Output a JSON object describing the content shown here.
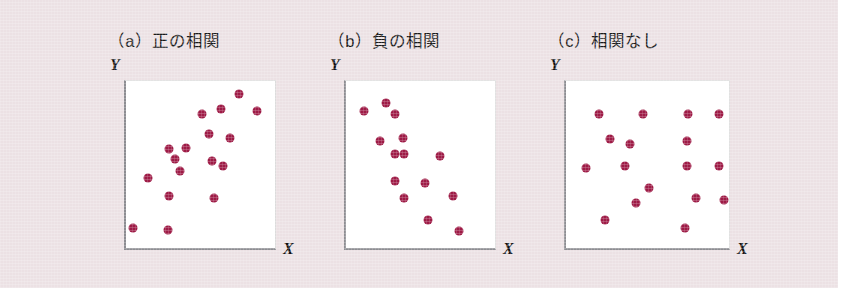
{
  "figure": {
    "background_color": "#ece1e4",
    "dot_color": "#9e1b46",
    "plot_background": "#ffffff",
    "axis_color": "#8d8d92"
  },
  "panels": [
    {
      "key": "positive",
      "title": "（a）正の相関",
      "y_label": "Y",
      "x_label": "X"
    },
    {
      "key": "negative",
      "title": "（b）負の相関",
      "y_label": "Y",
      "x_label": "X"
    },
    {
      "key": "none",
      "title": "（c）相関なし",
      "y_label": "Y",
      "x_label": "X"
    }
  ],
  "chart_data": [
    {
      "type": "scatter",
      "title": "（a）正の相関",
      "xlabel": "X",
      "ylabel": "Y",
      "xlim": [
        0,
        100
      ],
      "ylim": [
        0,
        100
      ],
      "grid": false,
      "legend": "none",
      "points": [
        {
          "x": 76,
          "y": 92
        },
        {
          "x": 88,
          "y": 82
        },
        {
          "x": 64,
          "y": 83
        },
        {
          "x": 51,
          "y": 80
        },
        {
          "x": 56,
          "y": 68
        },
        {
          "x": 70,
          "y": 66
        },
        {
          "x": 40,
          "y": 60
        },
        {
          "x": 29,
          "y": 59
        },
        {
          "x": 33,
          "y": 53
        },
        {
          "x": 58,
          "y": 52
        },
        {
          "x": 65,
          "y": 49
        },
        {
          "x": 36,
          "y": 46
        },
        {
          "x": 15,
          "y": 42
        },
        {
          "x": 29,
          "y": 31
        },
        {
          "x": 59,
          "y": 30
        },
        {
          "x": 5,
          "y": 12
        },
        {
          "x": 28,
          "y": 11
        }
      ]
    },
    {
      "type": "scatter",
      "title": "（b）負の相関",
      "xlabel": "X",
      "ylabel": "Y",
      "xlim": [
        0,
        100
      ],
      "ylim": [
        0,
        100
      ],
      "grid": false,
      "legend": "none",
      "points": [
        {
          "x": 27,
          "y": 87
        },
        {
          "x": 12,
          "y": 82
        },
        {
          "x": 33,
          "y": 80
        },
        {
          "x": 38,
          "y": 66
        },
        {
          "x": 23,
          "y": 64
        },
        {
          "x": 33,
          "y": 56
        },
        {
          "x": 39,
          "y": 56
        },
        {
          "x": 63,
          "y": 55
        },
        {
          "x": 33,
          "y": 40
        },
        {
          "x": 53,
          "y": 39
        },
        {
          "x": 39,
          "y": 30
        },
        {
          "x": 72,
          "y": 31
        },
        {
          "x": 55,
          "y": 17
        },
        {
          "x": 76,
          "y": 10
        }
      ]
    },
    {
      "type": "scatter",
      "title": "（c）相関なし",
      "xlabel": "X",
      "ylabel": "Y",
      "xlim": [
        0,
        100
      ],
      "ylim": [
        0,
        100
      ],
      "grid": false,
      "legend": "none",
      "points": [
        {
          "x": 20,
          "y": 80
        },
        {
          "x": 47,
          "y": 80
        },
        {
          "x": 75,
          "y": 80
        },
        {
          "x": 94,
          "y": 80
        },
        {
          "x": 27,
          "y": 65
        },
        {
          "x": 39,
          "y": 62
        },
        {
          "x": 74,
          "y": 64
        },
        {
          "x": 74,
          "y": 49
        },
        {
          "x": 94,
          "y": 49
        },
        {
          "x": 12,
          "y": 48
        },
        {
          "x": 36,
          "y": 49
        },
        {
          "x": 51,
          "y": 36
        },
        {
          "x": 80,
          "y": 30
        },
        {
          "x": 97,
          "y": 29
        },
        {
          "x": 43,
          "y": 27
        },
        {
          "x": 24,
          "y": 17
        },
        {
          "x": 73,
          "y": 12
        }
      ]
    }
  ]
}
